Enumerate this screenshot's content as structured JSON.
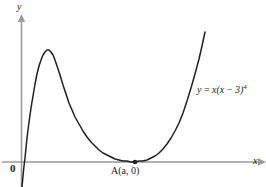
{
  "figure": {
    "background_color": "#ffffff",
    "axis_color": "#9a9a9a",
    "curve_color": "#231f20",
    "text_color": "#231f20"
  },
  "labels": {
    "y_axis": "y",
    "x_axis": "x",
    "origin": "0",
    "point_a": "A(a, 0)",
    "equation_lhs": "y",
    "equation_eq": "=",
    "equation_rhs_1": "x(x",
    "equation_minus": "−",
    "equation_rhs_2": "3)",
    "equation_exponent": "4"
  },
  "chart_data": {
    "type": "line",
    "title": "",
    "xlabel": "x",
    "ylabel": "y",
    "grid": false,
    "legend": null,
    "annotations": [
      {
        "name": "curve-equation",
        "text": "y = x(x − 3)⁴",
        "x_px": 197,
        "y_px": 85
      },
      {
        "name": "point-a",
        "text": "A(a, 0)",
        "x_px": 135,
        "y_px": 162
      },
      {
        "name": "origin",
        "text": "0",
        "x_px": 21,
        "y_px": 162
      }
    ],
    "function": "y = x(x - 3)^4",
    "roots": [
      0,
      3
    ],
    "root_multiplicities": [
      1,
      4
    ],
    "local_maximum": {
      "x": 0.6,
      "y_px": 51
    },
    "tangency_point": {
      "label": "A(a, 0)",
      "x": 3,
      "y": 0
    },
    "xlim": [
      -0.25,
      3.75
    ],
    "ylim": [
      -40,
      135
    ],
    "series": [
      {
        "name": "y = x(x - 3)^4",
        "points_px": [
          [
            22,
            187
          ],
          [
            23,
            176
          ],
          [
            24,
            166
          ],
          [
            25,
            158
          ],
          [
            26,
            148
          ],
          [
            27,
            138
          ],
          [
            28,
            130
          ],
          [
            29,
            122
          ],
          [
            31,
            108
          ],
          [
            33,
            96
          ],
          [
            35,
            84
          ],
          [
            37,
            74
          ],
          [
            39,
            66
          ],
          [
            41,
            60
          ],
          [
            43,
            55
          ],
          [
            45,
            52
          ],
          [
            47,
            50
          ],
          [
            49,
            50
          ],
          [
            51,
            52
          ],
          [
            53,
            55
          ],
          [
            55,
            60
          ],
          [
            57,
            66
          ],
          [
            60,
            75
          ],
          [
            63,
            85
          ],
          [
            66,
            94
          ],
          [
            69,
            103
          ],
          [
            72,
            110
          ],
          [
            75,
            117
          ],
          [
            79,
            124
          ],
          [
            83,
            131
          ],
          [
            87,
            137
          ],
          [
            91,
            142
          ],
          [
            95,
            146
          ],
          [
            99,
            150
          ],
          [
            103,
            153
          ],
          [
            107,
            155
          ],
          [
            111,
            157
          ],
          [
            115,
            159
          ],
          [
            119,
            160
          ],
          [
            123,
            161
          ],
          [
            127,
            161
          ],
          [
            131,
            162
          ],
          [
            135,
            162
          ],
          [
            139,
            161
          ],
          [
            143,
            161
          ],
          [
            147,
            160
          ],
          [
            151,
            158
          ],
          [
            155,
            156
          ],
          [
            159,
            153
          ],
          [
            163,
            149
          ],
          [
            167,
            144
          ],
          [
            171,
            138
          ],
          [
            175,
            131
          ],
          [
            179,
            123
          ],
          [
            183,
            113
          ],
          [
            187,
            101
          ],
          [
            191,
            88
          ],
          [
            195,
            74
          ],
          [
            199,
            59
          ],
          [
            202,
            46
          ],
          [
            205,
            32
          ]
        ]
      }
    ]
  }
}
